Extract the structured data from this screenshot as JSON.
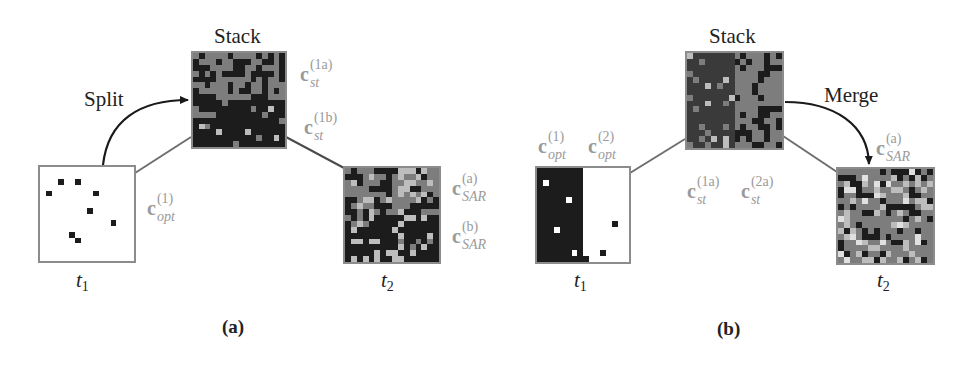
{
  "figure": {
    "panels": [
      {
        "id": "a",
        "caption": "(a)",
        "operation": "Split",
        "stack_title": "Stack",
        "t1_label": {
          "base": "t",
          "sub": "1"
        },
        "t2_label": {
          "base": "t",
          "sub": "2"
        },
        "labels": {
          "c_opt_1": {
            "sup": "(1)",
            "sub": "opt"
          },
          "c_st_1a": {
            "sup": "(1a)",
            "sub": "st"
          },
          "c_st_1b": {
            "sup": "(1b)",
            "sub": "st"
          },
          "c_sar_a": {
            "sup": "(a)",
            "sub": "SAR"
          },
          "c_sar_b": {
            "sup": "(b)",
            "sub": "SAR"
          }
        }
      },
      {
        "id": "b",
        "caption": "(b)",
        "operation": "Merge",
        "stack_title": "Stack",
        "t1_label": {
          "base": "t",
          "sub": "1"
        },
        "t2_label": {
          "base": "t",
          "sub": "2"
        },
        "labels": {
          "c_opt_1": {
            "sup": "(1)",
            "sub": "opt"
          },
          "c_opt_2": {
            "sup": "(2)",
            "sub": "opt"
          },
          "c_st_1a": {
            "sup": "(1a)",
            "sub": "st"
          },
          "c_st_2a": {
            "sup": "(2a)",
            "sub": "st"
          },
          "c_sar_a": {
            "sup": "(a)",
            "sub": "SAR"
          }
        }
      }
    ],
    "colors": {
      "dark": "#1c1c1c",
      "gray": "#7d7d7d",
      "light": "#bdbdbd",
      "white": "#ffffff",
      "label_gray": "#9a9a9a",
      "border": "#8c8c8c",
      "line": "#6e6e6e",
      "arrow": "#1a1a1a"
    }
  }
}
